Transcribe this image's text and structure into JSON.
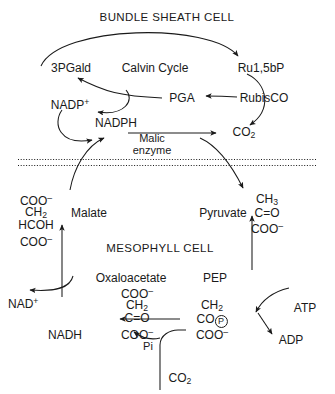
{
  "diagram": {
    "type": "biochemical-pathway",
    "stroke_color": "#1a1a1a",
    "background_color": "#ffffff"
  },
  "compartments": {
    "upper": {
      "label": "BUNDLE SHEATH CELL"
    },
    "lower": {
      "label": "MESOPHYLL CELL"
    },
    "membrane": {
      "style": "double dotted line"
    }
  },
  "bundle_sheath": {
    "cycle_label": "Calvin Cycle",
    "metabolites": {
      "pgald": "3PGald",
      "ru15bp": "Ru1,5bP",
      "pga": "PGA",
      "co2": "CO",
      "co2_sub": "2"
    },
    "enzymes": {
      "rubisco": "RubisCO",
      "malic": "Malic\nenzyme"
    },
    "malic_line1": "Malic",
    "malic_line2": "enzyme",
    "cofactors": {
      "nadp_ox": "NADP",
      "nadp_ox_sup": "+",
      "nadph": "NADPH"
    }
  },
  "mesophyll": {
    "metabolites": {
      "malate": "Malate",
      "pyruvate": "Pyruvate",
      "oxaloacetate": "Oxaloacetate",
      "pep": "PEP",
      "co2_in": "CO",
      "co2_in_sub": "2",
      "pi": "Pi"
    },
    "cofactors": {
      "nad_ox": "NAD",
      "nad_ox_sup": "+",
      "nadh": "NADH",
      "atp": "ATP",
      "adp": "ADP"
    }
  },
  "structures": {
    "malate": {
      "name": "malate-structure",
      "lines": [
        "COO-",
        "CH2",
        "HCOH",
        "COO-"
      ]
    },
    "pyruvate": {
      "name": "pyruvate-structure",
      "lines": [
        "CH3",
        "C=O",
        "COO-"
      ]
    },
    "oxaloacetate": {
      "name": "oxaloacetate-structure",
      "lines": [
        "COO-",
        "CH2",
        "C=O",
        "COO-"
      ]
    },
    "pep": {
      "name": "pep-structure",
      "lines": [
        "CH2",
        "CO(P)",
        "COO-"
      ]
    }
  }
}
